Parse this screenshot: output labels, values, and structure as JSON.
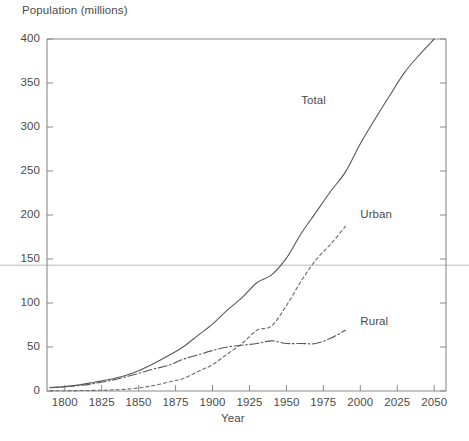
{
  "chart_data": {
    "type": "line",
    "title": "",
    "xlabel": "Year",
    "ylabel": "Population (millions)",
    "xlim": [
      1788,
      2058
    ],
    "ylim": [
      0,
      400
    ],
    "xticks": [
      1800,
      1825,
      1850,
      1875,
      1900,
      1925,
      1950,
      1975,
      2000,
      2025,
      2050
    ],
    "yticks": [
      0,
      50,
      100,
      150,
      200,
      250,
      300,
      350,
      400
    ],
    "grid": false,
    "legend_position": "inline-labels",
    "annotations": [
      {
        "name": "horizontal-reference-line",
        "type": "hline",
        "y": 143,
        "color": "#b9b9b9"
      }
    ],
    "series": [
      {
        "name": "Total",
        "style": "solid",
        "color": "#585858",
        "label_x": 1960,
        "label_y": 330,
        "points": [
          [
            1790,
            4
          ],
          [
            1800,
            5
          ],
          [
            1810,
            7
          ],
          [
            1820,
            10
          ],
          [
            1830,
            13
          ],
          [
            1840,
            17
          ],
          [
            1850,
            23
          ],
          [
            1860,
            31
          ],
          [
            1870,
            40
          ],
          [
            1880,
            50
          ],
          [
            1890,
            63
          ],
          [
            1900,
            76
          ],
          [
            1910,
            92
          ],
          [
            1920,
            106
          ],
          [
            1930,
            123
          ],
          [
            1940,
            132
          ],
          [
            1950,
            151
          ],
          [
            1960,
            179
          ],
          [
            1970,
            203
          ],
          [
            1980,
            227
          ],
          [
            1990,
            249
          ],
          [
            2000,
            281
          ],
          [
            2010,
            309
          ],
          [
            2020,
            336
          ],
          [
            2030,
            362
          ],
          [
            2040,
            382
          ],
          [
            2050,
            400
          ]
        ]
      },
      {
        "name": "Urban",
        "style": "dashed",
        "color": "#6a6a6a",
        "label_x": 2000,
        "label_y": 200,
        "points": [
          [
            1790,
            0.2
          ],
          [
            1800,
            0.3
          ],
          [
            1810,
            0.5
          ],
          [
            1820,
            0.7
          ],
          [
            1830,
            1.1
          ],
          [
            1840,
            1.8
          ],
          [
            1850,
            3.5
          ],
          [
            1860,
            6.2
          ],
          [
            1870,
            10
          ],
          [
            1880,
            14
          ],
          [
            1890,
            22
          ],
          [
            1900,
            30
          ],
          [
            1910,
            42
          ],
          [
            1920,
            54
          ],
          [
            1930,
            69
          ],
          [
            1940,
            74
          ],
          [
            1950,
            97
          ],
          [
            1960,
            125
          ],
          [
            1970,
            149
          ],
          [
            1980,
            167
          ],
          [
            1990,
            187
          ]
        ]
      },
      {
        "name": "Rural",
        "style": "dashdot",
        "color": "#585858",
        "label_x": 2000,
        "label_y": 78,
        "points": [
          [
            1790,
            3.7
          ],
          [
            1800,
            4.7
          ],
          [
            1810,
            6.2
          ],
          [
            1820,
            8.5
          ],
          [
            1830,
            11.5
          ],
          [
            1840,
            15.5
          ],
          [
            1850,
            20
          ],
          [
            1860,
            25
          ],
          [
            1870,
            29
          ],
          [
            1880,
            36
          ],
          [
            1890,
            41
          ],
          [
            1900,
            46
          ],
          [
            1910,
            50
          ],
          [
            1920,
            52
          ],
          [
            1930,
            54
          ],
          [
            1940,
            57
          ],
          [
            1950,
            54
          ],
          [
            1960,
            54
          ],
          [
            1970,
            54
          ],
          [
            1980,
            60
          ],
          [
            1990,
            69
          ]
        ]
      }
    ]
  },
  "axes": {
    "y_title": "Population (millions)",
    "x_title": "Year",
    "y_tick_labels": [
      "400",
      "350",
      "300",
      "250",
      "200",
      "150",
      "100",
      "50",
      "0"
    ],
    "x_tick_labels": [
      "1800",
      "1825",
      "1850",
      "1875",
      "1900",
      "1925",
      "1950",
      "1975",
      "2000",
      "2025",
      "2050"
    ]
  },
  "series_labels": {
    "total": "Total",
    "urban": "Urban",
    "rural": "Rural"
  },
  "colors": {
    "axis": "#8a8a8a",
    "line": "#585858",
    "reference_line": "#b9b9b9",
    "text": "#4a4a4a",
    "background": "#ffffff"
  }
}
